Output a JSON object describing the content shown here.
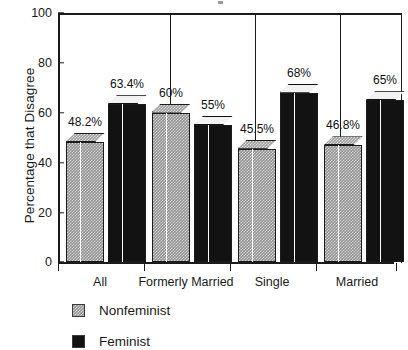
{
  "chart_data": {
    "type": "bar",
    "title": "",
    "xlabel": "",
    "ylabel": "Percentage that Disagree",
    "ylim": [
      0,
      100
    ],
    "yticks": [
      0,
      20,
      40,
      60,
      80,
      100
    ],
    "grid": false,
    "legend_position": "bottom-left",
    "categories": [
      "All",
      "Formerly Married",
      "Single",
      "Married"
    ],
    "series": [
      {
        "name": "Nonfeminist",
        "color": "#8e8e8e",
        "values": [
          48.2,
          60,
          45.5,
          46.8
        ],
        "labels": [
          "48.2%",
          "60%",
          "45.5%",
          "46.8%"
        ]
      },
      {
        "name": "Feminist",
        "color": "#121212",
        "values": [
          63.4,
          55,
          68,
          65
        ],
        "labels": [
          "63.4%",
          "55%",
          "68%",
          "65%"
        ]
      }
    ]
  },
  "axis": {
    "y_title": "Percentage that Disagree",
    "y_tick_labels": [
      "100",
      "80",
      "60",
      "40",
      "20",
      "0"
    ],
    "x_tick_labels": [
      "All",
      "Formerly Married",
      "Single",
      "Married"
    ]
  },
  "legend": {
    "items": [
      {
        "label": "Nonfeminist",
        "swatch": "hatched-gray"
      },
      {
        "label": "Feminist",
        "swatch": "solid-black"
      }
    ]
  }
}
